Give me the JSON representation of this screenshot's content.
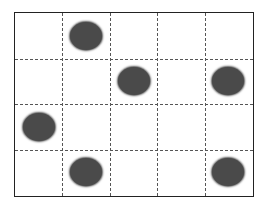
{
  "grid": {
    "rows": 4,
    "cols": 5,
    "border_color": "#222222",
    "line_color": "#555555",
    "line_style": "dashed"
  },
  "blob_color": "#4a4a4a",
  "blobs": [
    {
      "row": 0,
      "col": 1
    },
    {
      "row": 1,
      "col": 2
    },
    {
      "row": 1,
      "col": 4
    },
    {
      "row": 2,
      "col": 0
    },
    {
      "row": 3,
      "col": 1
    },
    {
      "row": 3,
      "col": 4
    }
  ]
}
